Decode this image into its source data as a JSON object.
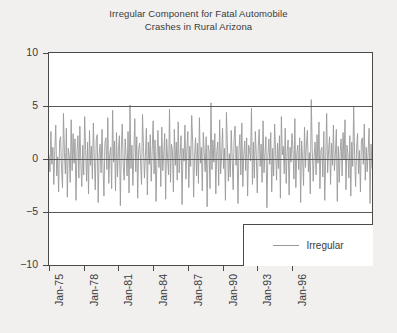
{
  "figure": {
    "background_color": "#f1f0ee",
    "plot_background_color": "#ffffff",
    "frame_color": "#4a4a4a",
    "series_color": "#9a9a9a",
    "grid_color": "#585858"
  },
  "legend": {
    "position": "lower-right",
    "entries": [
      {
        "label": "Irregular",
        "color": "#9a9a9a",
        "marker": "line"
      }
    ]
  },
  "chart_data": {
    "type": "line",
    "title": "Irregular Component for Fatal Automobile Crashes in Rural Arizona",
    "title_lines": [
      "Irregular Component for Fatal Automobile",
      "Crashes in Rural Arizona"
    ],
    "xlabel": "",
    "ylabel": "",
    "ylim": [
      -10,
      10
    ],
    "yticks": [
      10,
      5,
      0,
      -5,
      -10
    ],
    "ytick_labels": [
      "10",
      "5",
      "0",
      "-5",
      "-10"
    ],
    "gridlines_y": [
      5,
      0,
      -5
    ],
    "grid": true,
    "xtick_labels": [
      "Jan-75",
      "Jan-78",
      "Jan-81",
      "Jan-84",
      "Jan-87",
      "Jan-90",
      "Jan-93",
      "Jan-96"
    ],
    "xtick_rotation": 90,
    "x_start": "Jan-1975",
    "x_end": "Dec-1997",
    "x_frequency": "monthly",
    "series": [
      {
        "name": "Irregular",
        "color": "#9a9a9a",
        "values": [
          0.4,
          -1.2,
          2.6,
          -0.5,
          1.1,
          -2.4,
          0.8,
          3.2,
          -1.6,
          0.2,
          -3.1,
          1.7,
          2.1,
          -0.9,
          -2.7,
          4.3,
          0.6,
          -1.4,
          2.9,
          -3.6,
          1.0,
          0.3,
          -2.2,
          3.7,
          -1.1,
          2.4,
          -0.4,
          1.9,
          -3.9,
          0.7,
          2.2,
          -1.8,
          3.1,
          -0.2,
          -2.6,
          1.3,
          -1.5,
          4.0,
          0.9,
          -2.1,
          1.6,
          -3.3,
          2.7,
          -0.6,
          1.2,
          -1.9,
          3.4,
          0.1,
          -2.9,
          1.8,
          2.3,
          -4.1,
          0.5,
          1.4,
          -1.3,
          2.8,
          -0.8,
          -3.5,
          1.5,
          2.0,
          -1.0,
          3.9,
          -2.3,
          0.4,
          1.1,
          -2.8,
          4.6,
          -0.3,
          1.7,
          -3.0,
          2.5,
          -1.7,
          0.8,
          2.2,
          -4.4,
          1.0,
          3.3,
          -0.7,
          -2.0,
          1.9,
          0.2,
          -1.6,
          2.6,
          -3.2,
          5.1,
          -0.9,
          1.3,
          -2.5,
          0.6,
          3.8,
          -1.2,
          2.1,
          -3.7,
          0.9,
          1.5,
          -0.4,
          -2.4,
          4.2,
          1.1,
          -1.8,
          0.3,
          2.9,
          -3.4,
          1.6,
          -0.5,
          2.3,
          -2.1,
          0.7,
          3.6,
          -1.4,
          1.8,
          -4.0,
          0.2,
          2.7,
          -0.8,
          1.2,
          -2.6,
          3.0,
          -1.1,
          0.5,
          2.4,
          -3.8,
          1.9,
          0.1,
          -1.5,
          4.7,
          -2.2,
          1.4,
          0.8,
          -3.1,
          2.8,
          -0.6,
          1.6,
          -2.0,
          3.5,
          -1.3,
          0.4,
          2.2,
          -4.3,
          1.0,
          -0.2,
          3.2,
          -1.9,
          0.9,
          2.6,
          -2.7,
          1.2,
          -0.7,
          4.1,
          1.7,
          -3.6,
          0.3,
          2.0,
          -1.6,
          1.5,
          -2.3,
          3.9,
          -0.4,
          1.1,
          -3.0,
          2.5,
          0.6,
          -1.2,
          2.1,
          -4.5,
          1.3,
          0.8,
          -2.8,
          5.3,
          -1.0,
          1.8,
          -0.3,
          2.4,
          -3.3,
          0.7,
          1.6,
          -2.5,
          3.7,
          -1.4,
          0.2,
          2.9,
          -0.9,
          1.0,
          -3.9,
          4.4,
          1.5,
          -2.1,
          0.5,
          -1.7,
          2.7,
          0.1,
          -2.9,
          1.9,
          3.1,
          -0.6,
          1.2,
          -4.2,
          0.8,
          2.3,
          -1.5,
          3.4,
          -2.6,
          0.4,
          1.7,
          -1.1,
          2.0,
          -3.5,
          1.3,
          0.9,
          -0.2,
          4.8,
          -2.4,
          1.6,
          -1.8,
          2.6,
          0.3,
          -3.2,
          1.1,
          2.8,
          -0.7,
          1.4,
          -2.2,
          3.6,
          -1.3,
          0.6,
          2.1,
          -4.6,
          0.2,
          1.9,
          -0.5,
          2.5,
          -3.1,
          1.0,
          -1.6,
          3.3,
          0.8,
          -2.0,
          1.5,
          -0.9,
          2.2,
          -3.7,
          4.0,
          0.4,
          1.2,
          -1.4,
          2.9,
          -2.3,
          0.7,
          1.8,
          -3.4,
          1.1,
          -0.3,
          2.4,
          0.9,
          -1.9,
          3.8,
          -2.7,
          0.5,
          1.3,
          -1.0,
          2.0,
          -4.1,
          1.7,
          0.1,
          -2.5,
          3.0,
          -0.8,
          1.4,
          2.7,
          -1.2,
          0.6,
          -3.3,
          5.6,
          1.0,
          -2.1,
          0.3,
          1.6,
          -1.5,
          2.3,
          -0.4,
          3.5,
          -2.8,
          0.8,
          1.1,
          -1.7,
          2.6,
          -3.9,
          0.2,
          4.3,
          -1.3,
          0.9,
          2.1,
          -2.4,
          1.5,
          -0.6,
          3.2,
          -1.1,
          0.4,
          2.8,
          -4.0,
          1.2,
          -2.2,
          0.7,
          1.9,
          -1.6,
          2.5,
          -0.1,
          3.7,
          -2.9,
          1.3,
          0.5,
          -1.8,
          2.2,
          -3.5,
          1.6,
          -0.7,
          4.9,
          0.3,
          -2.6,
          1.0,
          2.4,
          -1.4,
          0.8,
          -3.1,
          1.7,
          2.0,
          -0.5,
          3.3,
          -2.0,
          1.1,
          -1.2,
          0.6,
          2.9,
          -4.2,
          1.4,
          -0.9
        ]
      }
    ]
  }
}
